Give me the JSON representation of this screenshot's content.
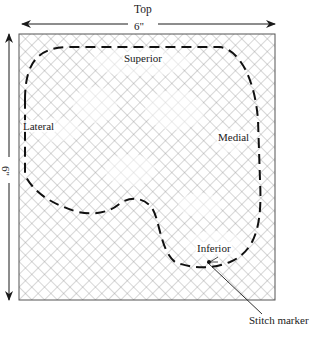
{
  "diagram": {
    "top_label": "Top",
    "width_dimension": "6\"",
    "height_dimension": "6\"",
    "regions": {
      "superior": "Superior",
      "lateral": "Lateral",
      "medial": "Medial",
      "inferior": "Inferior"
    },
    "callout": "Stitch marker"
  },
  "colors": {
    "ink": "#1a1a1a",
    "mesh": "#8a8a8a",
    "background": "#ffffff"
  }
}
